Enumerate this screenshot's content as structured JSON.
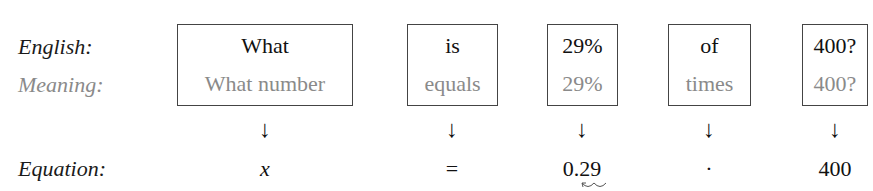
{
  "row_labels": {
    "english": "English:",
    "meaning": "Meaning:",
    "equation": "Equation:"
  },
  "columns": [
    {
      "english": "What",
      "meaning": "What number",
      "arrow": "↓",
      "equation": "x"
    },
    {
      "english": "is",
      "meaning": "equals",
      "arrow": "↓",
      "equation": "="
    },
    {
      "english": "29%",
      "meaning": "29%",
      "arrow": "↓",
      "equation": "0.29"
    },
    {
      "english": "of",
      "meaning": "times",
      "arrow": "↓",
      "equation": "·"
    },
    {
      "english": "400?",
      "meaning": "400?",
      "arrow": "↓",
      "equation": "400"
    }
  ],
  "colors": {
    "english_text": "#111111",
    "meaning_text": "#8a8a8a",
    "box_border": "#444444"
  }
}
